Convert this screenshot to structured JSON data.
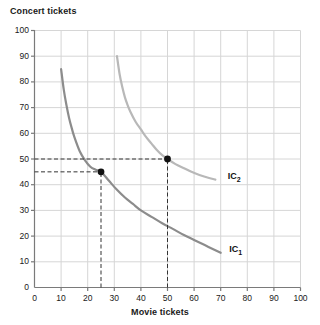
{
  "chart_data": {
    "type": "line",
    "title": "",
    "xlabel": "Movie tickets",
    "ylabel": "Concert tickets",
    "xlim": [
      0,
      100
    ],
    "ylim": [
      0,
      100
    ],
    "xticks": [
      0,
      10,
      20,
      30,
      40,
      50,
      60,
      70,
      80,
      90,
      100
    ],
    "yticks": [
      0,
      10,
      20,
      30,
      40,
      50,
      60,
      70,
      80,
      90,
      100
    ],
    "grid": true,
    "legend_position": "inline-right-of-curves",
    "series": [
      {
        "name": "IC1",
        "label": "IC",
        "label_sub": "1",
        "color": "#8c8c8c",
        "description": "Lower indifference curve",
        "points": [
          [
            10,
            85
          ],
          [
            11,
            77
          ],
          [
            12,
            71
          ],
          [
            13,
            66
          ],
          [
            14,
            62
          ],
          [
            15,
            58.5
          ],
          [
            17,
            53
          ],
          [
            19,
            49.5
          ],
          [
            21,
            47
          ],
          [
            23,
            45.8
          ],
          [
            25,
            45
          ],
          [
            28,
            41.5
          ],
          [
            31,
            38
          ],
          [
            34,
            35
          ],
          [
            37,
            32.5
          ],
          [
            40,
            30
          ],
          [
            44,
            27.5
          ],
          [
            48,
            25
          ],
          [
            52,
            22.8
          ],
          [
            56,
            20.5
          ],
          [
            60,
            18.5
          ],
          [
            64,
            16.5
          ],
          [
            68,
            14.5
          ],
          [
            70,
            13.5
          ]
        ]
      },
      {
        "name": "IC2",
        "label": "IC",
        "label_sub": "2",
        "color": "#b8b8b8",
        "description": "Higher indifference curve",
        "points": [
          [
            31,
            90
          ],
          [
            32,
            83
          ],
          [
            33,
            78
          ],
          [
            34,
            74
          ],
          [
            35,
            71
          ],
          [
            36,
            68.5
          ],
          [
            38,
            64.5
          ],
          [
            40,
            61.5
          ],
          [
            42,
            58.5
          ],
          [
            44,
            56
          ],
          [
            46,
            53.5
          ],
          [
            48,
            51.5
          ],
          [
            50,
            50
          ],
          [
            53,
            48
          ],
          [
            56,
            46.5
          ],
          [
            59,
            45
          ],
          [
            62,
            43.8
          ],
          [
            65,
            42.8
          ],
          [
            68,
            42
          ]
        ]
      }
    ],
    "markers": [
      {
        "name": "point-ic1",
        "x": 25,
        "y": 45,
        "color": "#111111",
        "on_series": "IC1",
        "guides": [
          "horizontal-to-y-axis",
          "vertical-to-x-axis"
        ]
      },
      {
        "name": "point-ic2",
        "x": 50,
        "y": 50,
        "color": "#111111",
        "on_series": "IC2",
        "guides": [
          "horizontal-to-y-axis",
          "vertical-to-x-axis"
        ]
      }
    ],
    "guide_lines": [
      {
        "name": "guide-h-50",
        "type": "horizontal",
        "value": 50,
        "from_x": 0,
        "to_x": 50,
        "style": "dashed"
      },
      {
        "name": "guide-h-45",
        "type": "horizontal",
        "value": 45,
        "from_x": 0,
        "to_x": 25,
        "style": "dashed"
      },
      {
        "name": "guide-v-25",
        "type": "vertical",
        "value": 25,
        "from_y": 0,
        "to_y": 45,
        "style": "dashed"
      },
      {
        "name": "guide-v-50",
        "type": "vertical",
        "value": 50,
        "from_y": 0,
        "to_y": 50,
        "style": "dashed"
      }
    ],
    "colors": {
      "grid": "#d6d6d6",
      "axis": "#7a7a7a",
      "text": "#1a1a1a",
      "ic1": "#8c8c8c",
      "ic2": "#b8b8b8",
      "marker": "#111111",
      "guide": "#333333",
      "background": "#ffffff"
    }
  }
}
